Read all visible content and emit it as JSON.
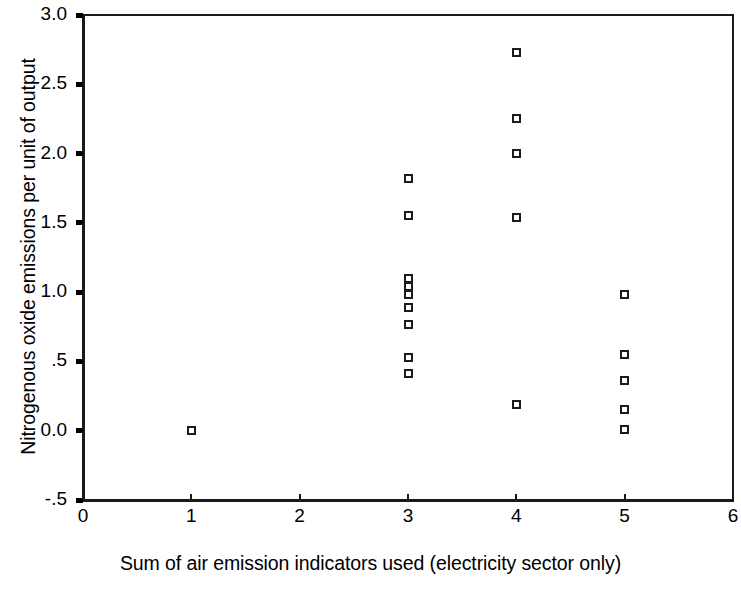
{
  "chart_data": {
    "type": "scatter",
    "title": "",
    "xlabel": "Sum of air emission indicators used (electricity sector only)",
    "ylabel": "Nitrogenous oxide emissions per unit of output",
    "xlim": [
      0,
      6
    ],
    "ylim": [
      -0.5,
      3.0
    ],
    "grid": false,
    "legend": null,
    "xticks": [
      0,
      1,
      2,
      3,
      4,
      5,
      6
    ],
    "xticklabels": [
      "0",
      "1",
      "2",
      "3",
      "4",
      "5",
      "6"
    ],
    "yticks": [
      -0.5,
      0.0,
      0.5,
      1.0,
      1.5,
      2.0,
      2.5,
      3.0
    ],
    "yticklabels": [
      "-.5",
      "0.0",
      ".5",
      "1.0",
      "1.5",
      "2.0",
      "2.5",
      "3.0"
    ],
    "marker": "open-square",
    "marker_color": "#1c1c1c",
    "points": [
      {
        "x": 1,
        "y": 0.0
      },
      {
        "x": 3,
        "y": 1.82
      },
      {
        "x": 3,
        "y": 1.55
      },
      {
        "x": 3,
        "y": 1.1
      },
      {
        "x": 3,
        "y": 1.04
      },
      {
        "x": 3,
        "y": 0.98
      },
      {
        "x": 3,
        "y": 0.89
      },
      {
        "x": 3,
        "y": 0.77
      },
      {
        "x": 3,
        "y": 0.53
      },
      {
        "x": 3,
        "y": 0.41
      },
      {
        "x": 4,
        "y": 2.73
      },
      {
        "x": 4,
        "y": 2.25
      },
      {
        "x": 4,
        "y": 2.0
      },
      {
        "x": 4,
        "y": 1.54
      },
      {
        "x": 4,
        "y": 0.19
      },
      {
        "x": 5,
        "y": 0.98
      },
      {
        "x": 5,
        "y": 0.55
      },
      {
        "x": 5,
        "y": 0.36
      },
      {
        "x": 5,
        "y": 0.15
      },
      {
        "x": 5,
        "y": 0.01
      }
    ]
  }
}
